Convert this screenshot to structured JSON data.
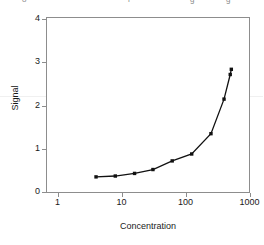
{
  "header_fragments": [
    {
      "text": "o",
      "x": 22
    },
    {
      "text": "r",
      "x": 128
    },
    {
      "text": "g",
      "x": 190
    },
    {
      "text": "g",
      "x": 226
    }
  ],
  "axes": {
    "y": {
      "title": "Signal",
      "ticks": [
        0,
        1,
        2,
        3,
        4
      ],
      "limits": [
        0,
        4.2
      ]
    },
    "x": {
      "title": "Concentration",
      "ticks": [
        1,
        10,
        100,
        1000
      ],
      "tick_labels": [
        "1",
        "10",
        "100",
        "1000"
      ],
      "scale": "log",
      "limits": [
        1,
        1000
      ]
    }
  },
  "chart_data": {
    "type": "line",
    "title": "",
    "subtitle": "",
    "xlabel": "Concentration",
    "ylabel": "Signal",
    "xscale": "log",
    "xlim": [
      1,
      1000
    ],
    "ylim": [
      0,
      4.2
    ],
    "grid": false,
    "legend": "none",
    "marker": "filled-square",
    "line_color": "#111111",
    "marker_color": "#111111",
    "series": [
      {
        "name": "Calibration curve",
        "x": [
          4,
          8,
          16,
          31,
          62,
          125,
          250,
          400,
          500
        ],
        "y": [
          0.35,
          0.37,
          0.43,
          0.52,
          0.72,
          0.88,
          1.35,
          2.15,
          2.72
        ],
        "points": [
          {
            "x": 4,
            "y": 0.35
          },
          {
            "x": 8,
            "y": 0.37
          },
          {
            "x": 16,
            "y": 0.43
          },
          {
            "x": 31,
            "y": 0.52
          },
          {
            "x": 62,
            "y": 0.72
          },
          {
            "x": 125,
            "y": 0.88
          },
          {
            "x": 250,
            "y": 1.35
          },
          {
            "x": 400,
            "y": 2.15
          },
          {
            "x": 500,
            "y": 2.72
          },
          {
            "x": 520,
            "y": 2.84
          }
        ]
      }
    ]
  }
}
